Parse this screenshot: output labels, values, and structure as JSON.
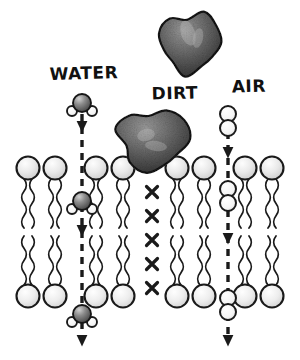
{
  "figure": {
    "background_color": "#ffffff",
    "ink_color": "#1a1a1a"
  },
  "labels": [
    {
      "id": "water",
      "text": "WATER",
      "x": 84,
      "y": 79,
      "font_size": 17
    },
    {
      "id": "dirt",
      "text": "DIRT",
      "x": 175,
      "y": 99,
      "font_size": 17
    },
    {
      "id": "air",
      "text": "AIR",
      "x": 249,
      "y": 92,
      "font_size": 17
    }
  ],
  "diagram_data": {
    "type": "schematic",
    "subject": "phospholipid bilayer permeability",
    "legend": [
      "WATER",
      "DIRT",
      "AIR"
    ],
    "membrane": {
      "head_radius": 11.5,
      "top_row_head_cy": 168,
      "bottom_row_head_cy": 296,
      "tail_top_start": 179,
      "tail_top_end": 228,
      "tail_bottom_start": 236,
      "tail_bottom_end": 285,
      "lipid_x": [
        28,
        55,
        96,
        123,
        177,
        204,
        245,
        272
      ],
      "head_fill_top": "#e8e8e8",
      "head_fill_bottom": "#ebebeb",
      "head_stroke": "#1a1a1a",
      "head_stroke_width": 2.1,
      "tail_stroke_width": 1.8
    },
    "blocked_marker": {
      "glyph": "x",
      "label": "blocked-x-mark",
      "x": 152,
      "ys": [
        192,
        216,
        240,
        264,
        288
      ],
      "size": 11,
      "color": "#1a1a1a"
    },
    "permeation_paths": [
      {
        "id": "water-path",
        "substance": "WATER",
        "x": 82,
        "passes": true,
        "dash_pattern": "7 6",
        "arrow_ys": [
          126,
          230,
          340
        ],
        "molecule_type": "water",
        "molecule_positions": [
          {
            "cx": 82,
            "cy": 103
          },
          {
            "cx": 82,
            "cy": 201
          },
          {
            "cx": 82,
            "cy": 314
          }
        ]
      },
      {
        "id": "air-path",
        "substance": "AIR",
        "x": 228,
        "passes": true,
        "dash_pattern": "7 6",
        "arrow_ys": [
          152,
          238,
          340
        ],
        "molecule_type": "air",
        "molecule_positions": [
          {
            "cx": 228,
            "cy": 121
          },
          {
            "cx": 228,
            "cy": 196
          },
          {
            "cx": 228,
            "cy": 305
          }
        ]
      }
    ],
    "particles": [
      {
        "id": "dirt-particle-upper",
        "label": "dirt-particle",
        "cx": 190,
        "cy": 42,
        "rx": 30,
        "ry": 30,
        "blocked": true
      },
      {
        "id": "dirt-particle-on-membrane",
        "label": "dirt-particle",
        "cx": 152,
        "cy": 139,
        "rx": 34,
        "ry": 31,
        "blocked": true
      }
    ],
    "molecules": {
      "water": {
        "name": "water-molecule",
        "oxygen": {
          "r": 9,
          "fill": "#7b7b7b"
        },
        "hydrogen": {
          "r": 5,
          "fill": "#fbfbfb"
        },
        "hydrogen_offsets": [
          {
            "dx": -10,
            "dy": 8
          },
          {
            "dx": 10,
            "dy": 8
          }
        ]
      },
      "air": {
        "name": "air-molecule",
        "atom": {
          "r": 8,
          "fill": "#fbfbfb"
        },
        "atom_offsets": [
          {
            "dx": 0,
            "dy": -7
          },
          {
            "dx": 0,
            "dy": 7
          }
        ]
      }
    }
  }
}
